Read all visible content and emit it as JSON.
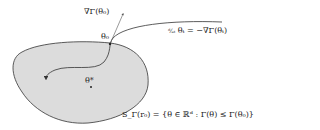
{
  "diagram": {
    "labels": {
      "gradient": "∇Γ(θ₀)",
      "theta0": "θ₀",
      "flow_equation": "d/dt θₜ = −∇Γ(θₜ)",
      "optimum": "θ*",
      "sublevel_set": "S_Γ(r₀) = {θ ∈ ℝᵈ : Γ(θ) ≤ Γ(θ₀)}"
    },
    "display": {
      "gradient": "∇Γ(θ₀)",
      "theta0": "θ₀",
      "flow_frac": "ᵈ⁄ₐₜ",
      "flow_rest": "θₜ = −∇Γ(θₜ)",
      "optimum": "θ*",
      "sublevel_set": "S_Γ(r₀) = {θ ∈ ℝᵈ : Γ(θ) ≤ Γ(θ₀)}"
    },
    "colors": {
      "region_fill": "#dcdcdc",
      "stroke": "#333333",
      "background": "#ffffff"
    }
  }
}
